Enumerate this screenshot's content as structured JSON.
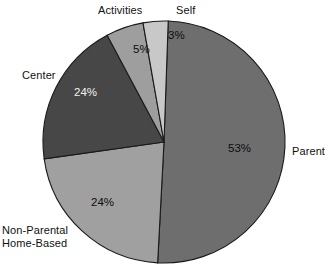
{
  "chart_data": {
    "type": "pie",
    "title": "",
    "subtitle": "",
    "xlabel": "",
    "ylabel": "",
    "legend_position": "none",
    "grid": false,
    "labels_outside": true,
    "categories": [
      "Parent",
      "Non-Parental Home-Based",
      "Center",
      "Activities",
      "Self"
    ],
    "values": [
      53,
      24,
      24,
      5,
      3
    ],
    "value_labels": [
      "53%",
      "24%",
      "24%",
      "5%",
      "3%"
    ],
    "units": "percent",
    "total": 109,
    "start_angle_deg": 2,
    "direction": "clockwise",
    "slices": [
      {
        "name": "Parent",
        "label": "Parent",
        "value": 53,
        "value_label": "53%",
        "color": "#6e6e6e",
        "label_color": "#0d0d0d",
        "start_deg": 2,
        "end_deg": 183
      },
      {
        "name": "Non-Parental Home-Based",
        "label": "Non-Parental\nHome-Based",
        "label_line_1": "Non-Parental",
        "label_line_2": "Home-Based",
        "value": 24,
        "value_label": "24%",
        "color": "#a0a0a0",
        "label_color": "#0d0d0d",
        "start_deg": 183,
        "end_deg": 262
      },
      {
        "name": "Center",
        "label": "Center",
        "value": 24,
        "value_label": "24%",
        "color": "#474747",
        "label_color": "#f2f2f2",
        "start_deg": 262,
        "end_deg": 332
      },
      {
        "name": "Activities",
        "label": "Activities",
        "value": 5,
        "value_label": "5%",
        "color": "#9e9e9e",
        "label_color": "#0d0d0d",
        "start_deg": 332,
        "end_deg": 350
      },
      {
        "name": "Self",
        "label": "Self",
        "value": 3,
        "value_label": "3%",
        "color": "#c8c8c8",
        "label_color": "#0d0d0d",
        "start_deg": 350,
        "end_deg": 362
      }
    ],
    "geometry": {
      "center_x": 164,
      "center_y": 142,
      "radius": 121
    },
    "colors": {
      "background": "#ffffff",
      "outline": "#1a1a1a",
      "parent": "#6e6e6e",
      "non_parental_home_based": "#a0a0a0",
      "center": "#474747",
      "activities": "#9e9e9e",
      "self": "#c8c8c8"
    }
  }
}
